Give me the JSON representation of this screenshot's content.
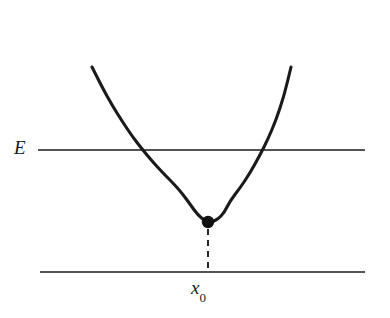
{
  "figure": {
    "kind": "physics-potential-well-diagram",
    "background_color": "#ffffff",
    "stroke_color": "#1a1a1a",
    "width": 390,
    "height": 318
  },
  "labels": {
    "energy": "E",
    "position_symbol": "x",
    "position_subscript": "0",
    "position_full": "x0"
  },
  "chart_data": {
    "type": "line",
    "title": "",
    "subtitle": "",
    "xlabel": "",
    "ylabel": "",
    "xlim": [
      0,
      390
    ],
    "ylim": [
      318,
      0
    ],
    "grid": false,
    "legend": null,
    "series": [
      {
        "name": "potential-curve",
        "role": "parabola",
        "type": "quadratic",
        "vertex": [
          208,
          222
        ],
        "curvature_a": 0.01152,
        "x_domain": [
          92,
          291
        ],
        "endpoints": [
          [
            92,
            67
          ],
          [
            291,
            67
          ]
        ],
        "stroke_width": 3.1,
        "stroke_color": "#1a1a1a",
        "points": [
          [
            92,
            67
          ],
          [
            102,
            87
          ],
          [
            112,
            105
          ],
          [
            122,
            121
          ],
          [
            132,
            136
          ],
          [
            142,
            149
          ],
          [
            152,
            161
          ],
          [
            162,
            172
          ],
          [
            172,
            182
          ],
          [
            182,
            193
          ],
          [
            192,
            207
          ],
          [
            198,
            215
          ],
          [
            204,
            220
          ],
          [
            208,
            222
          ],
          [
            212,
            222
          ],
          [
            218,
            219
          ],
          [
            224,
            213
          ],
          [
            230,
            201
          ],
          [
            240,
            188
          ],
          [
            250,
            173
          ],
          [
            260,
            155
          ],
          [
            268,
            139
          ],
          [
            276,
            120
          ],
          [
            284,
            96
          ],
          [
            291,
            67
          ]
        ]
      },
      {
        "name": "energy-level-line",
        "role": "horizontal-line",
        "y": 150,
        "x_start": 38,
        "x_end": 365,
        "stroke_width": 1.6,
        "stroke_color": "#1a1a1a",
        "label": "E"
      },
      {
        "name": "baseline-axis",
        "role": "horizontal-line",
        "y": 272,
        "x_start": 40,
        "x_end": 365,
        "stroke_width": 1.6,
        "stroke_color": "#1a1a1a"
      },
      {
        "name": "x0-dropline",
        "role": "dashed-vertical-line",
        "x": 208,
        "y_start": 229,
        "y_end": 272,
        "stroke_width": 1.9,
        "dash_pattern": [
          6,
          5
        ],
        "stroke_color": "#1a1a1a"
      }
    ],
    "markers": [
      {
        "name": "minimum-point",
        "x": 208,
        "y": 222,
        "radius": 6.2,
        "fill": "#111111",
        "shape": "circle"
      }
    ],
    "annotations": [
      {
        "name": "energy-label",
        "text": "E",
        "x": 22,
        "y": 150,
        "anchor": "middle-right",
        "style": "italic-serif"
      },
      {
        "name": "x0-label",
        "text": "x0",
        "x": 208,
        "y": 290,
        "anchor": "top-center",
        "style": "italic-serif-with-subscript"
      }
    ],
    "intersections": {
      "name": "turning-points",
      "points": [
        [
          117,
          150
        ],
        [
          277,
          150
        ]
      ]
    }
  }
}
